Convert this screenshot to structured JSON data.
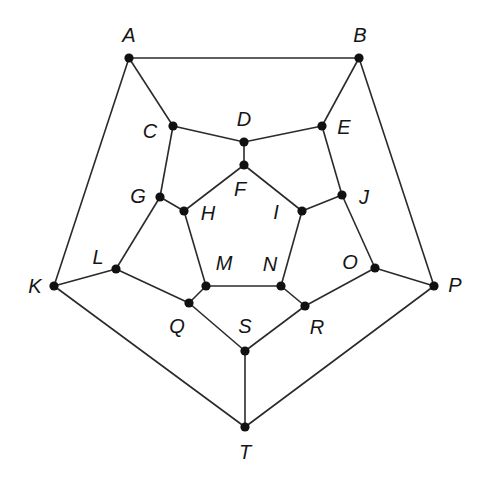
{
  "diagram": {
    "type": "graph",
    "nodes": [
      {
        "id": "A",
        "label": "A",
        "x": 129,
        "y": 58,
        "lx": 129,
        "ly": 35
      },
      {
        "id": "B",
        "label": "B",
        "x": 359,
        "y": 58,
        "lx": 360,
        "ly": 35
      },
      {
        "id": "C",
        "label": "C",
        "x": 173,
        "y": 126,
        "lx": 150,
        "ly": 131
      },
      {
        "id": "D",
        "label": "D",
        "x": 244,
        "y": 142,
        "lx": 244,
        "ly": 119
      },
      {
        "id": "E",
        "label": "E",
        "x": 322,
        "y": 126,
        "lx": 344,
        "ly": 127
      },
      {
        "id": "F",
        "label": "F",
        "x": 244,
        "y": 165,
        "lx": 240,
        "ly": 189
      },
      {
        "id": "G",
        "label": "G",
        "x": 160,
        "y": 197,
        "lx": 138,
        "ly": 196
      },
      {
        "id": "H",
        "label": "H",
        "x": 184,
        "y": 211,
        "lx": 208,
        "ly": 213
      },
      {
        "id": "I",
        "label": "I",
        "x": 302,
        "y": 211,
        "lx": 276,
        "ly": 212
      },
      {
        "id": "J",
        "label": "J",
        "x": 342,
        "y": 195,
        "lx": 364,
        "ly": 197
      },
      {
        "id": "K",
        "label": "K",
        "x": 54,
        "y": 286,
        "lx": 35,
        "ly": 286
      },
      {
        "id": "L",
        "label": "L",
        "x": 116,
        "y": 269,
        "lx": 98,
        "ly": 257
      },
      {
        "id": "M",
        "label": "M",
        "x": 206,
        "y": 286,
        "lx": 224,
        "ly": 263
      },
      {
        "id": "N",
        "label": "N",
        "x": 281,
        "y": 286,
        "lx": 270,
        "ly": 264
      },
      {
        "id": "O",
        "label": "O",
        "x": 375,
        "y": 268,
        "lx": 350,
        "ly": 262
      },
      {
        "id": "P",
        "label": "P",
        "x": 434,
        "y": 286,
        "lx": 455,
        "ly": 285
      },
      {
        "id": "Q",
        "label": "Q",
        "x": 189,
        "y": 303,
        "lx": 177,
        "ly": 326
      },
      {
        "id": "R",
        "label": "R",
        "x": 305,
        "y": 306,
        "lx": 317,
        "ly": 327
      },
      {
        "id": "S",
        "label": "S",
        "x": 245,
        "y": 351,
        "lx": 245,
        "ly": 326
      },
      {
        "id": "T",
        "label": "T",
        "x": 245,
        "y": 427,
        "lx": 245,
        "ly": 452
      }
    ],
    "edges": [
      [
        "A",
        "B"
      ],
      [
        "A",
        "K"
      ],
      [
        "A",
        "C"
      ],
      [
        "B",
        "E"
      ],
      [
        "B",
        "P"
      ],
      [
        "C",
        "D"
      ],
      [
        "C",
        "G"
      ],
      [
        "D",
        "E"
      ],
      [
        "D",
        "F"
      ],
      [
        "E",
        "J"
      ],
      [
        "F",
        "H"
      ],
      [
        "F",
        "I"
      ],
      [
        "G",
        "H"
      ],
      [
        "G",
        "L"
      ],
      [
        "H",
        "M"
      ],
      [
        "I",
        "J"
      ],
      [
        "I",
        "N"
      ],
      [
        "J",
        "O"
      ],
      [
        "K",
        "L"
      ],
      [
        "K",
        "T"
      ],
      [
        "L",
        "Q"
      ],
      [
        "M",
        "N"
      ],
      [
        "M",
        "Q"
      ],
      [
        "N",
        "R"
      ],
      [
        "O",
        "P"
      ],
      [
        "O",
        "R"
      ],
      [
        "P",
        "T"
      ],
      [
        "Q",
        "S"
      ],
      [
        "R",
        "S"
      ],
      [
        "S",
        "T"
      ]
    ]
  }
}
